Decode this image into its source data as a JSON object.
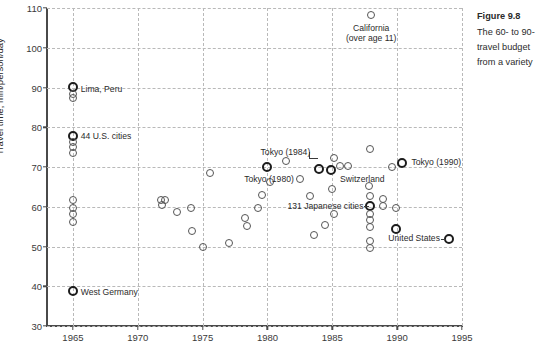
{
  "figure": {
    "caption_title": "Figure 9.8",
    "caption_body": "The 60- to 90-\ntravel budget\nfrom a variety"
  },
  "chart_data": {
    "type": "scatter",
    "title": "",
    "xlabel": "",
    "ylabel": "Travel time, min/person/day",
    "xlim": [
      1963,
      1995
    ],
    "ylim": [
      30,
      110
    ],
    "xticks": [
      1965,
      1970,
      1975,
      1980,
      1985,
      1990,
      1995
    ],
    "yticks": [
      30,
      40,
      50,
      60,
      70,
      80,
      90,
      100,
      110
    ],
    "grid": true,
    "legend": "none",
    "points": [
      {
        "x": 1965,
        "y": 90.2,
        "emphasis": "bold"
      },
      {
        "x": 1965,
        "y": 88.4,
        "emphasis": "normal"
      },
      {
        "x": 1965,
        "y": 87.3,
        "emphasis": "normal"
      },
      {
        "x": 1965,
        "y": 77.8,
        "emphasis": "bold"
      },
      {
        "x": 1965,
        "y": 76.2,
        "emphasis": "normal"
      },
      {
        "x": 1965,
        "y": 75.0,
        "emphasis": "normal"
      },
      {
        "x": 1965,
        "y": 73.6,
        "emphasis": "normal"
      },
      {
        "x": 1965,
        "y": 61.6,
        "emphasis": "normal"
      },
      {
        "x": 1965,
        "y": 59.8,
        "emphasis": "normal"
      },
      {
        "x": 1965,
        "y": 58.2,
        "emphasis": "normal"
      },
      {
        "x": 1965,
        "y": 56.1,
        "emphasis": "normal"
      },
      {
        "x": 1965,
        "y": 38.8,
        "emphasis": "bold"
      },
      {
        "x": 1971.8,
        "y": 61.7,
        "emphasis": "normal"
      },
      {
        "x": 1972.1,
        "y": 61.7,
        "emphasis": "normal"
      },
      {
        "x": 1971.9,
        "y": 60.5,
        "emphasis": "normal"
      },
      {
        "x": 1973.0,
        "y": 58.8,
        "emphasis": "normal"
      },
      {
        "x": 1974.1,
        "y": 59.8,
        "emphasis": "normal"
      },
      {
        "x": 1974.2,
        "y": 53.8,
        "emphasis": "normal"
      },
      {
        "x": 1975.0,
        "y": 50.0,
        "emphasis": "normal"
      },
      {
        "x": 1975.6,
        "y": 68.6,
        "emphasis": "normal"
      },
      {
        "x": 1977.0,
        "y": 50.9,
        "emphasis": "normal"
      },
      {
        "x": 1978.3,
        "y": 57.1,
        "emphasis": "normal"
      },
      {
        "x": 1978.4,
        "y": 55.2,
        "emphasis": "normal"
      },
      {
        "x": 1979.3,
        "y": 59.8,
        "emphasis": "normal"
      },
      {
        "x": 1979.6,
        "y": 62.9,
        "emphasis": "normal"
      },
      {
        "x": 1980.0,
        "y": 69.9,
        "emphasis": "bold"
      },
      {
        "x": 1980.2,
        "y": 66.3,
        "emphasis": "normal"
      },
      {
        "x": 1981.4,
        "y": 71.6,
        "emphasis": "normal"
      },
      {
        "x": 1982.5,
        "y": 67.0,
        "emphasis": "normal"
      },
      {
        "x": 1983.3,
        "y": 62.8,
        "emphasis": "normal"
      },
      {
        "x": 1983.6,
        "y": 53.0,
        "emphasis": "normal"
      },
      {
        "x": 1984.0,
        "y": 69.4,
        "emphasis": "bold"
      },
      {
        "x": 1984.9,
        "y": 69.3,
        "emphasis": "bold"
      },
      {
        "x": 1985.1,
        "y": 72.2,
        "emphasis": "normal"
      },
      {
        "x": 1985.6,
        "y": 70.2,
        "emphasis": "normal"
      },
      {
        "x": 1986.2,
        "y": 70.2,
        "emphasis": "normal"
      },
      {
        "x": 1985.0,
        "y": 64.4,
        "emphasis": "normal"
      },
      {
        "x": 1985.1,
        "y": 58.3,
        "emphasis": "normal"
      },
      {
        "x": 1984.4,
        "y": 55.5,
        "emphasis": "normal"
      },
      {
        "x": 1988.0,
        "y": 108.2,
        "emphasis": "normal"
      },
      {
        "x": 1987.9,
        "y": 74.6,
        "emphasis": "normal"
      },
      {
        "x": 1987.8,
        "y": 65.2,
        "emphasis": "normal"
      },
      {
        "x": 1987.9,
        "y": 62.6,
        "emphasis": "normal"
      },
      {
        "x": 1987.9,
        "y": 60.2,
        "emphasis": "bold"
      },
      {
        "x": 1987.9,
        "y": 58.3,
        "emphasis": "normal"
      },
      {
        "x": 1987.9,
        "y": 56.6,
        "emphasis": "normal"
      },
      {
        "x": 1987.9,
        "y": 54.8,
        "emphasis": "normal"
      },
      {
        "x": 1987.9,
        "y": 51.4,
        "emphasis": "normal"
      },
      {
        "x": 1987.9,
        "y": 49.5,
        "emphasis": "normal"
      },
      {
        "x": 1988.9,
        "y": 62.0,
        "emphasis": "normal"
      },
      {
        "x": 1988.9,
        "y": 60.3,
        "emphasis": "normal"
      },
      {
        "x": 1989.6,
        "y": 69.9,
        "emphasis": "normal"
      },
      {
        "x": 1989.9,
        "y": 59.6,
        "emphasis": "normal"
      },
      {
        "x": 1989.9,
        "y": 54.3,
        "emphasis": "bold"
      },
      {
        "x": 1990.4,
        "y": 70.9,
        "emphasis": "bold"
      },
      {
        "x": 1994.0,
        "y": 51.8,
        "emphasis": "bold"
      }
    ],
    "annotations": [
      {
        "name": "lima-peru",
        "text": "Lima, Peru",
        "x": 1965.6,
        "y": 89.4,
        "align": "left"
      },
      {
        "name": "44-us-cities",
        "text": "44 U.S. cities",
        "x": 1965.6,
        "y": 77.6,
        "align": "left"
      },
      {
        "name": "west-germany",
        "text": "West Germany",
        "x": 1965.6,
        "y": 38.2,
        "align": "left"
      },
      {
        "name": "california",
        "text": "California\n(over age 11)",
        "x": 1988.0,
        "y": 104.8,
        "align": "center"
      },
      {
        "name": "tokyo-1980",
        "text": "Tokyo (1980)",
        "x": 1978.2,
        "y": 66.8,
        "align": "left"
      },
      {
        "name": "tokyo-1984",
        "text": "Tokyo (1984)",
        "x": 1983.3,
        "y": 73.6,
        "align": "right"
      },
      {
        "name": "switzerland",
        "text": "Switzerland",
        "x": 1985.6,
        "y": 66.7,
        "align": "left"
      },
      {
        "name": "tokyo-1990",
        "text": "Tokyo (1990)",
        "x": 1991.1,
        "y": 70.9,
        "align": "left"
      },
      {
        "name": "131-japanese-cities",
        "text": "131 Japanese cities",
        "x": 1987.4,
        "y": 60.0,
        "align": "right"
      },
      {
        "name": "united-states",
        "text": "United States",
        "x": 1993.3,
        "y": 51.8,
        "align": "right"
      }
    ]
  }
}
